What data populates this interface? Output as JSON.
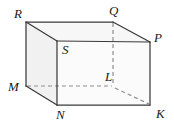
{
  "figure": {
    "kind": "geometry-diagram",
    "shape": "cuboid",
    "width": 174,
    "height": 126,
    "background_color": "#ffffff",
    "edge_color": "#3a3a3a",
    "hidden_edge_color": "#8e8e8e",
    "label_color": "#1a1a1a",
    "face_colors": {
      "front": "#fbfbfb",
      "left": "#f1f1f1",
      "top": "#f7f7f7"
    }
  },
  "vertices": [
    {
      "name": "R",
      "label": "R",
      "x": 26,
      "y": 22,
      "label_x": 14,
      "label_y": 7,
      "hidden": false
    },
    {
      "name": "Q",
      "label": "Q",
      "x": 113,
      "y": 22,
      "label_x": 109,
      "label_y": 4,
      "hidden": false
    },
    {
      "name": "S",
      "label": "S",
      "x": 57,
      "y": 41,
      "label_x": 62,
      "label_y": 43,
      "hidden": false
    },
    {
      "name": "P",
      "label": "P",
      "x": 150,
      "y": 42,
      "label_x": 154,
      "label_y": 31,
      "hidden": false
    },
    {
      "name": "M",
      "label": "M",
      "x": 26,
      "y": 86,
      "label_x": 8,
      "label_y": 80,
      "hidden": false
    },
    {
      "name": "L",
      "label": "L",
      "x": 113,
      "y": 86,
      "label_x": 105,
      "label_y": 70,
      "hidden": true
    },
    {
      "name": "N",
      "label": "N",
      "x": 57,
      "y": 105,
      "label_x": 56,
      "label_y": 108,
      "hidden": false
    },
    {
      "name": "K",
      "label": "K",
      "x": 150,
      "y": 105,
      "label_x": 156,
      "label_y": 107,
      "hidden": false
    }
  ],
  "edges": {
    "visible": [
      {
        "from": "R",
        "to": "Q"
      },
      {
        "from": "R",
        "to": "S"
      },
      {
        "from": "R",
        "to": "M"
      },
      {
        "from": "Q",
        "to": "P"
      },
      {
        "from": "S",
        "to": "P"
      },
      {
        "from": "S",
        "to": "N"
      },
      {
        "from": "P",
        "to": "K"
      },
      {
        "from": "M",
        "to": "N"
      },
      {
        "from": "N",
        "to": "K"
      }
    ],
    "hidden": [
      {
        "from": "M",
        "to": "L"
      },
      {
        "from": "Q",
        "to": "L"
      },
      {
        "from": "L",
        "to": "K"
      }
    ]
  },
  "faces": [
    {
      "name": "left-face",
      "path": "R S N M",
      "fill": "#f1f1f1"
    },
    {
      "name": "top-face",
      "path": "R Q P S",
      "fill": "#f7f7f7"
    },
    {
      "name": "front-face",
      "path": "S P K N",
      "fill": "#fbfbfb"
    }
  ]
}
